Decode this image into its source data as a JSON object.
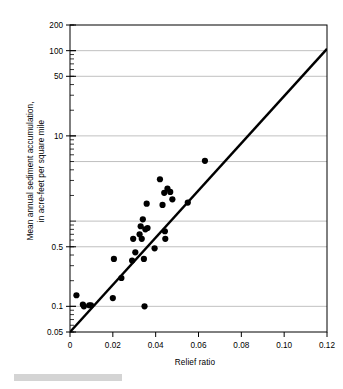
{
  "chart_data": {
    "type": "scatter",
    "title": "",
    "xlabel": "Relief ratio",
    "ylabel": "Mean annual sediment accumulation, in acre-feet per square mile",
    "ylabel_line1": "Mean annual sediment accumulation,",
    "ylabel_line2": "in acre-feet per square mile",
    "xscale": "linear",
    "yscale": "log",
    "xlim": [
      0,
      0.12
    ],
    "ylim": [
      0.05,
      200
    ],
    "grid": "horizontal",
    "legend": "none",
    "xticks": [
      0,
      0.02,
      0.04,
      0.06,
      0.08,
      0.1,
      0.12
    ],
    "xticklabels": [
      "0",
      "0.02",
      "0.04",
      "0.06",
      "0.08",
      "0.10",
      "0.12"
    ],
    "yticks": [
      0.05,
      0.1,
      0.5,
      10,
      50,
      100,
      200
    ],
    "yticklabels": [
      "0.05",
      "0.1",
      "0.5",
      "10",
      "50",
      "100",
      "200"
    ],
    "gridline_values": [
      0.1,
      0.5,
      1,
      5,
      10,
      50,
      100
    ],
    "series": [
      {
        "name": "Observations",
        "marker": "filled-circle",
        "color": "#000000",
        "points": [
          {
            "x": 0.003,
            "y": 0.135
          },
          {
            "x": 0.006,
            "y": 0.105
          },
          {
            "x": 0.0065,
            "y": 0.1
          },
          {
            "x": 0.009,
            "y": 0.103
          },
          {
            "x": 0.0098,
            "y": 0.103
          },
          {
            "x": 0.02,
            "y": 0.125
          },
          {
            "x": 0.0205,
            "y": 0.36
          },
          {
            "x": 0.024,
            "y": 0.215
          },
          {
            "x": 0.029,
            "y": 0.345
          },
          {
            "x": 0.0295,
            "y": 0.62
          },
          {
            "x": 0.0305,
            "y": 0.43
          },
          {
            "x": 0.0325,
            "y": 0.7
          },
          {
            "x": 0.033,
            "y": 0.87
          },
          {
            "x": 0.0335,
            "y": 0.62
          },
          {
            "x": 0.034,
            "y": 1.05
          },
          {
            "x": 0.0345,
            "y": 0.36
          },
          {
            "x": 0.0348,
            "y": 0.1
          },
          {
            "x": 0.0352,
            "y": 0.8
          },
          {
            "x": 0.0358,
            "y": 1.6
          },
          {
            "x": 0.0362,
            "y": 0.83
          },
          {
            "x": 0.0395,
            "y": 0.48
          },
          {
            "x": 0.042,
            "y": 3.1
          },
          {
            "x": 0.0432,
            "y": 1.55
          },
          {
            "x": 0.044,
            "y": 2.15
          },
          {
            "x": 0.0443,
            "y": 0.76
          },
          {
            "x": 0.0445,
            "y": 0.62
          },
          {
            "x": 0.0455,
            "y": 2.4
          },
          {
            "x": 0.0468,
            "y": 2.2
          },
          {
            "x": 0.0478,
            "y": 1.8
          },
          {
            "x": 0.055,
            "y": 1.65
          },
          {
            "x": 0.063,
            "y": 5.1
          }
        ]
      }
    ],
    "trendline": {
      "name": "Fitted regression line",
      "color": "#000000",
      "style": "solid",
      "x_start": 0.0,
      "y_start": 0.05,
      "x_end": 0.12,
      "y_end": 105
    }
  },
  "figure": {
    "background_color": "#ffffff",
    "axis_color": "#000000",
    "gridline_color": "#b0b0b0",
    "marker_color": "#000000",
    "caption_bar_color": "#d4d4d4"
  }
}
